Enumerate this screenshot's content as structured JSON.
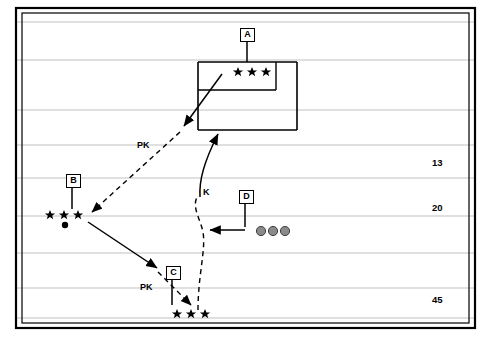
{
  "diagram": {
    "field": {
      "outer_border_color": "#000000",
      "line_color": "#b8b8b8",
      "background": "#ffffff",
      "horizontal_lines_y": [
        22,
        60,
        110,
        145,
        178,
        216,
        253,
        288,
        318
      ],
      "yard_markers": [
        {
          "label": "13",
          "x": 437,
          "y": 162
        },
        {
          "label": "20",
          "x": 437,
          "y": 206
        },
        {
          "label": "45",
          "x": 437,
          "y": 299
        }
      ]
    },
    "markers": [
      {
        "name": "A",
        "label": "A",
        "x": 240,
        "y": 28
      },
      {
        "name": "B",
        "label": "B",
        "x": 66,
        "y": 174
      },
      {
        "name": "C",
        "label": "C",
        "x": 166,
        "y": 266
      },
      {
        "name": "D",
        "label": "D",
        "x": 239,
        "y": 190
      }
    ],
    "route_labels": [
      {
        "name": "pk-label-top",
        "label": "PK",
        "x": 137,
        "y": 141
      },
      {
        "name": "k-label",
        "label": "K",
        "x": 203,
        "y": 188
      },
      {
        "name": "pk-label-bottom",
        "label": "PK",
        "x": 140,
        "y": 283
      }
    ],
    "player_groups": [
      {
        "name": "star-group-top",
        "glyph": "star",
        "count": 3,
        "x": 233,
        "y": 72,
        "fill": "#000000"
      },
      {
        "name": "star-group-left",
        "glyph": "star",
        "count": 3,
        "x": 44,
        "y": 214,
        "fill": "#000000"
      },
      {
        "name": "star-group-bottom",
        "glyph": "star",
        "count": 3,
        "x": 171,
        "y": 314,
        "fill": "#000000"
      },
      {
        "name": "dot-group-right",
        "glyph": "circle",
        "count": 3,
        "x": 256,
        "y": 231,
        "fill": "#888888"
      },
      {
        "name": "ball-dot-left",
        "glyph": "circle",
        "count": 1,
        "x": 63,
        "y": 224,
        "fill": "#000000"
      }
    ],
    "arrows": [
      {
        "name": "arrow-a-to-pk",
        "style": "solid",
        "from": "A",
        "to": "pk-point"
      },
      {
        "name": "arrow-pk-to-b",
        "style": "dashed",
        "from": "pk-point",
        "to": "B"
      },
      {
        "name": "arrow-b-to-pk-bottom",
        "style": "solid",
        "from": "B",
        "to": "pk-bottom"
      },
      {
        "name": "arrow-pk-bottom-to-c",
        "style": "dashed",
        "from": "pk-bottom",
        "to": "C"
      },
      {
        "name": "arrow-k-route-up",
        "style": "solid",
        "from": "k-route",
        "to": "top"
      },
      {
        "name": "arrow-k-route-dashed",
        "style": "dashed",
        "from": "bottom-stars",
        "to": "k-route"
      },
      {
        "name": "arrow-d-to-left",
        "style": "solid",
        "from": "D",
        "to": "center"
      }
    ]
  }
}
